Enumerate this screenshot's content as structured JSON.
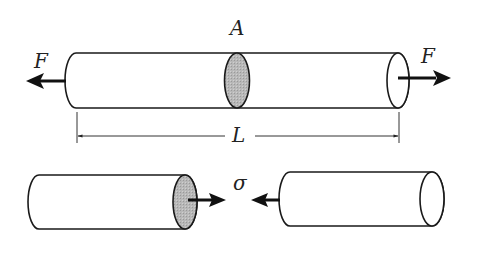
{
  "diagram": {
    "type": "axial-loaded-bar-free-body",
    "colors": {
      "stroke": "#1a1a1a",
      "section_fill": "#b8b8b8",
      "background": "#ffffff"
    },
    "top_bar": {
      "section_label": "A",
      "left_force_label": "F",
      "right_force_label": "F",
      "length_label": "L"
    },
    "bottom_pieces": {
      "stress_label_left": "σ",
      "stress_label_center": "σ"
    }
  }
}
